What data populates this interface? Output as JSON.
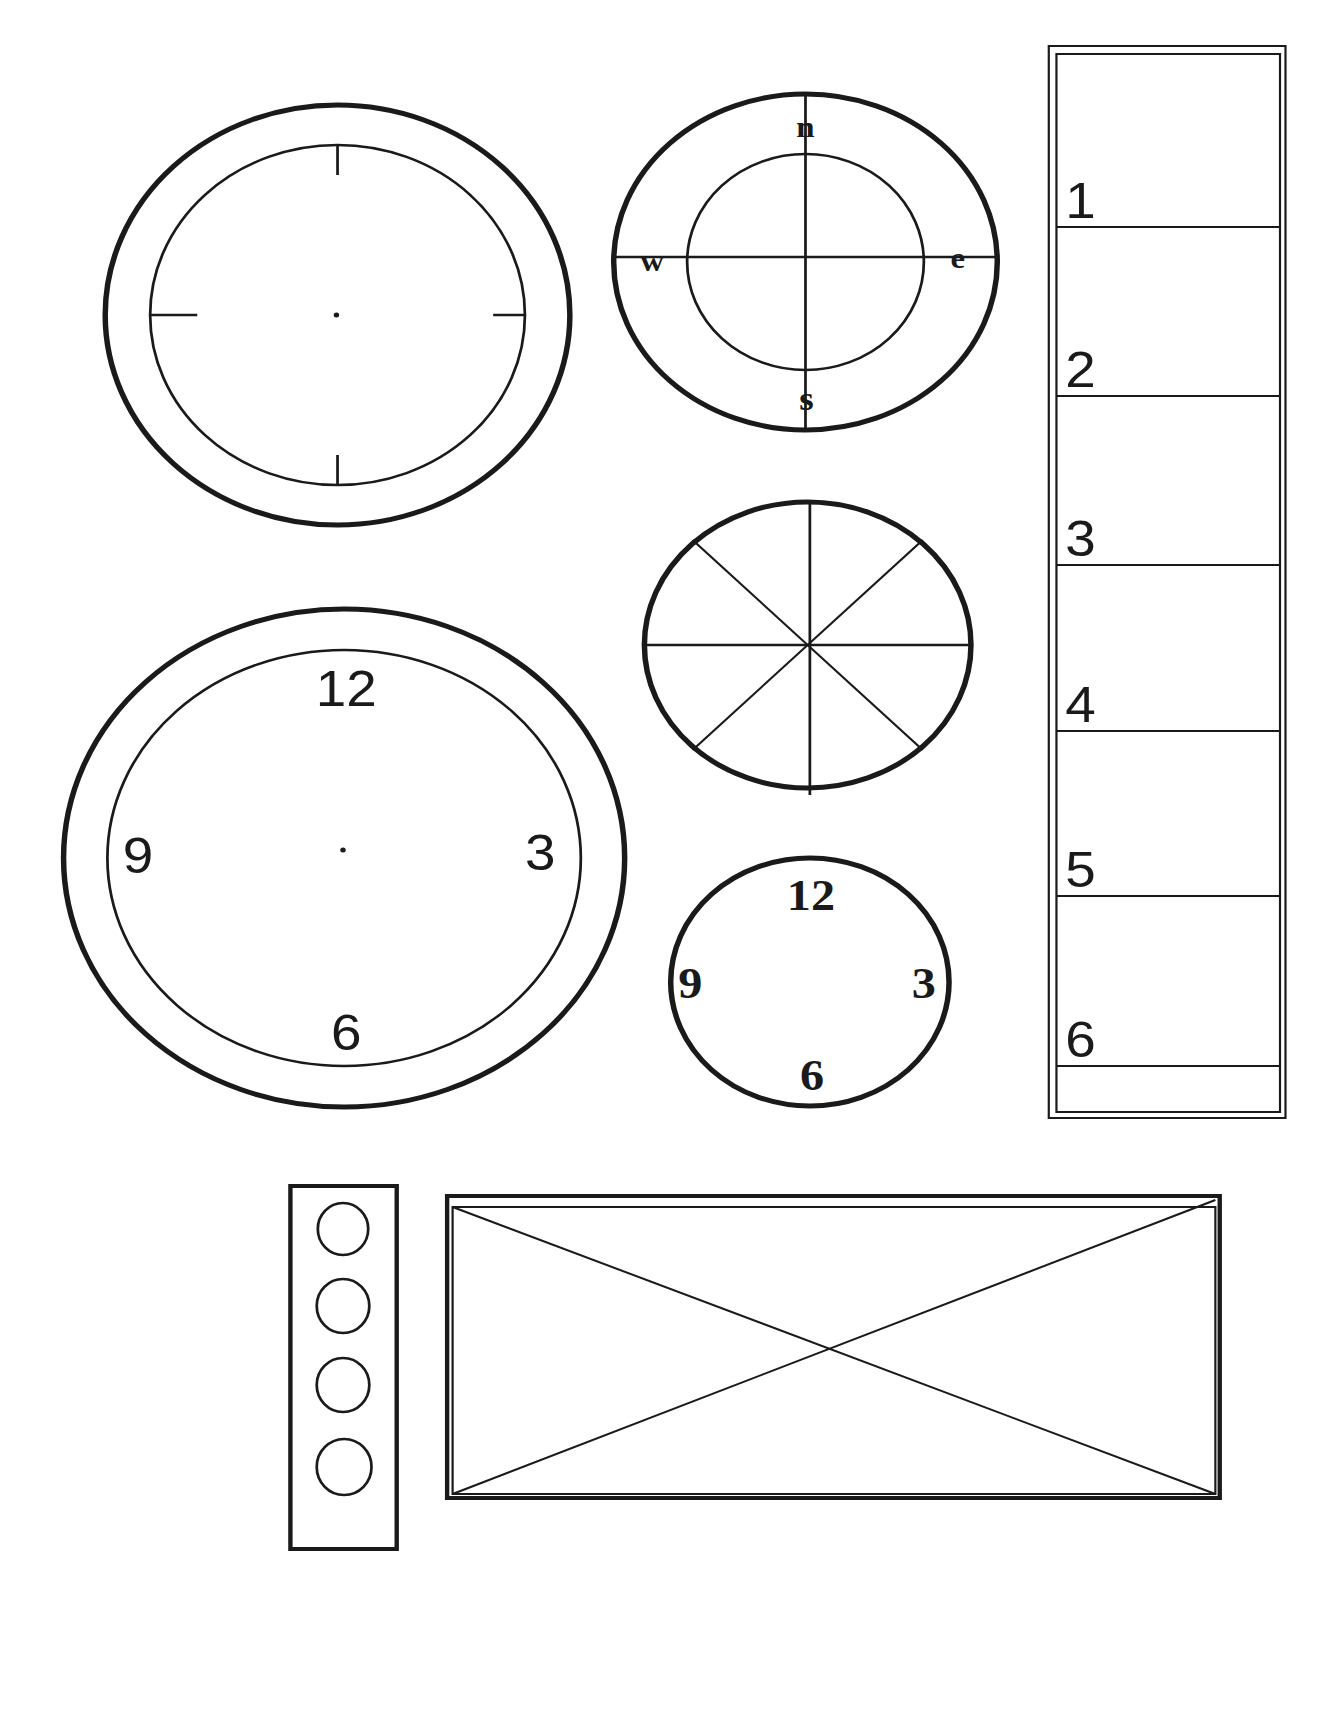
{
  "page": {
    "background": "#ffffff",
    "ink_color": "#1a1a1a"
  },
  "blank_clock": {
    "description": "Large clock face with four tick marks and center dot",
    "ticks": [
      "top",
      "right",
      "bottom",
      "left"
    ]
  },
  "compass": {
    "labels": {
      "north": "n",
      "east": "e",
      "south": "s",
      "west": "w"
    }
  },
  "sector_wheel": {
    "segments": 8
  },
  "large_clock": {
    "numbers": {
      "top": "12",
      "right": "3",
      "bottom": "6",
      "left": "9"
    }
  },
  "small_clock": {
    "numbers": {
      "top": "12",
      "right": "3",
      "bottom": "6",
      "left": "9"
    }
  },
  "vertical_scale": {
    "marks": [
      "1",
      "2",
      "3",
      "4",
      "5",
      "6"
    ]
  },
  "traffic_light_strip": {
    "circles": 4
  },
  "crossed_rectangle": {
    "description": "Rectangle with two diagonal lines"
  }
}
